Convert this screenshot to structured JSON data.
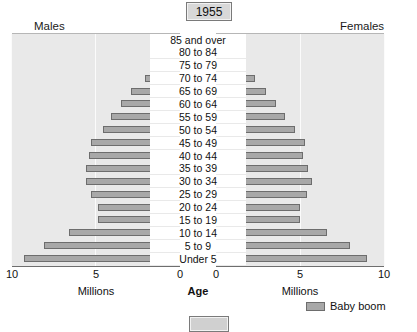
{
  "title": "1955",
  "headers": {
    "males": "Males",
    "females": "Females"
  },
  "axis": {
    "left_ticks": [
      "10",
      "5",
      "0"
    ],
    "right_ticks": [
      "0",
      "5",
      "10"
    ],
    "left_caption": "Millions",
    "right_caption": "Millions",
    "center_caption": "Age"
  },
  "legend": {
    "label": "Baby boom",
    "swatch_color": "#a8a8a8"
  },
  "colors": {
    "bar_fill": "#a8a8a8",
    "bar_border": "#6d6d6d",
    "panel_background": "#e9e9e9",
    "gridline": "#fbfbfb",
    "page_background": "#ffffff"
  },
  "chart_data": {
    "type": "bar",
    "title": "1955",
    "xlabel": "Millions",
    "ylabel": "Age",
    "xlim": [
      0,
      10
    ],
    "grid": true,
    "legend_position": "bottom-right",
    "orientation": "population-pyramid",
    "categories": [
      "85 and over",
      "80 to 84",
      "75 to 79",
      "70 to 74",
      "65 to 69",
      "60 to 64",
      "55 to 59",
      "50 to 54",
      "45 to 49",
      "40 to 44",
      "35 to 39",
      "30 to 34",
      "25 to 29",
      "20 to 24",
      "15 to 19",
      "10 to 14",
      "5 to 9",
      "Under 5"
    ],
    "series": [
      {
        "name": "Males",
        "values": [
          0.3,
          0.8,
          1.4,
          2.1,
          2.9,
          3.5,
          4.1,
          4.6,
          5.3,
          5.4,
          5.6,
          5.6,
          5.3,
          4.9,
          4.9,
          6.6,
          8.1,
          9.3
        ]
      },
      {
        "name": "Females",
        "values": [
          0.4,
          0.9,
          1.5,
          2.3,
          3.0,
          3.6,
          4.1,
          4.7,
          5.3,
          5.2,
          5.5,
          5.7,
          5.4,
          5.0,
          5.0,
          6.6,
          8.0,
          9.0
        ]
      }
    ]
  }
}
